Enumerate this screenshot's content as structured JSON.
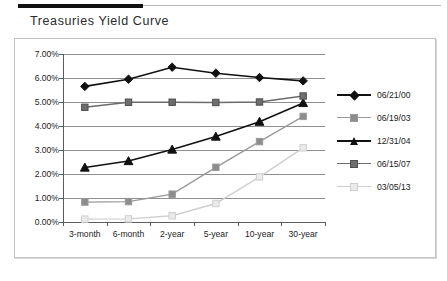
{
  "page": {
    "title": "Treasuries Yield Curve"
  },
  "chart_data": {
    "type": "line",
    "title": "Treasuries Yield Curve",
    "xlabel": "",
    "ylabel": "",
    "categories": [
      "3-month",
      "6-month",
      "2-year",
      "5-year",
      "10-year",
      "30-year"
    ],
    "ylim": [
      0,
      7
    ],
    "ytick_labels": [
      "0.00%",
      "1.00%",
      "2.00%",
      "3.00%",
      "4.00%",
      "5.00%",
      "6.00%",
      "7.00%"
    ],
    "ytick_values": [
      0,
      1,
      2,
      3,
      4,
      5,
      6,
      7
    ],
    "grid": true,
    "legend_position": "right",
    "value_suffix": "%",
    "series": [
      {
        "name": "06/21/00",
        "marker": "diamond",
        "color": "#111111",
        "line_color": "#111111",
        "marker_fill": "#111111",
        "values": [
          5.65,
          5.95,
          6.45,
          6.2,
          6.02,
          5.88
        ]
      },
      {
        "name": "06/19/03",
        "marker": "square",
        "color": "#9a9a9a",
        "line_color": "#9a9a9a",
        "marker_fill": "#8c8c8c",
        "values": [
          0.83,
          0.85,
          1.16,
          2.28,
          3.35,
          4.4
        ]
      },
      {
        "name": "12/31/04",
        "marker": "triangle",
        "color": "#111111",
        "line_color": "#111111",
        "marker_fill": "#111111",
        "values": [
          2.27,
          2.54,
          3.02,
          3.56,
          4.18,
          4.96
        ]
      },
      {
        "name": "06/15/07",
        "marker": "square",
        "color": "#4f4f4f",
        "line_color": "#6b6b6b",
        "marker_fill": "#6e6e6e",
        "values": [
          4.78,
          4.99,
          4.99,
          4.98,
          5.0,
          5.25
        ]
      },
      {
        "name": "03/05/13",
        "marker": "square",
        "color": "#cfcfcf",
        "line_color": "#cfcfcf",
        "marker_fill": "#eaeaea",
        "values": [
          0.12,
          0.13,
          0.26,
          0.77,
          1.88,
          3.09
        ]
      }
    ]
  }
}
